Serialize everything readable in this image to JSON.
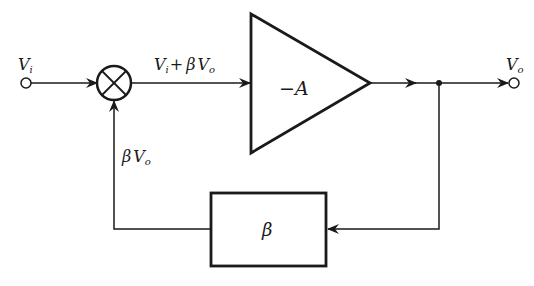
{
  "diagram": {
    "type": "feedback-block-diagram",
    "colors": {
      "stroke": "#1a1a1a",
      "background": "#ffffff"
    },
    "labels": {
      "input": {
        "main": "V",
        "sub": "i"
      },
      "output": {
        "main": "V",
        "sub": "o"
      },
      "sum_out": {
        "a_main": "V",
        "a_sub": "i",
        "op": "+",
        "b_coef": "β",
        "b_main": "V",
        "b_sub": "o"
      },
      "amplifier": "−A",
      "feedback_block": "β",
      "feedback_signal": {
        "coef": "β",
        "main": "V",
        "sub": "o"
      }
    },
    "nodes": [
      {
        "id": "input-terminal",
        "label": "Vi"
      },
      {
        "id": "summing-junction",
        "symbol": "⊗"
      },
      {
        "id": "amplifier",
        "label": "−A"
      },
      {
        "id": "branch-point"
      },
      {
        "id": "output-terminal",
        "label": "Vo"
      },
      {
        "id": "feedback-block",
        "label": "β"
      }
    ],
    "edges": [
      {
        "from": "input-terminal",
        "to": "summing-junction"
      },
      {
        "from": "summing-junction",
        "to": "amplifier",
        "label": "Vi + βVo"
      },
      {
        "from": "amplifier",
        "to": "branch-point"
      },
      {
        "from": "branch-point",
        "to": "output-terminal"
      },
      {
        "from": "branch-point",
        "to": "feedback-block"
      },
      {
        "from": "feedback-block",
        "to": "summing-junction",
        "label": "βVo"
      }
    ]
  }
}
